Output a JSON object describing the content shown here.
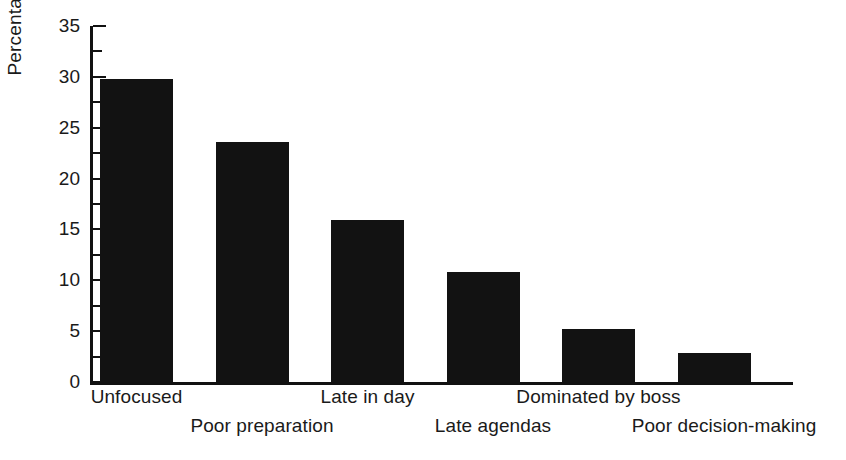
{
  "chart_data": {
    "type": "bar",
    "title": "",
    "subtitle": "",
    "xlabel": "",
    "ylabel": "Percentage",
    "ylim": [
      0,
      35
    ],
    "ytick_values": [
      0,
      5,
      10,
      15,
      20,
      25,
      30,
      35
    ],
    "ytick_labels": [
      "0",
      "5",
      "10",
      "15",
      "20",
      "25",
      "30",
      "35"
    ],
    "minor_tick_interval": 2.5,
    "grid": false,
    "legend": null,
    "bar_color": "#121212",
    "axis_color": "#111111",
    "background_color": "#ffffff",
    "categories": [
      "Unfocused",
      "Poor preparation",
      "Late in day",
      "Late agendas",
      "Dominated by boss",
      "Poor decision-making"
    ],
    "values": [
      29.8,
      23.6,
      15.9,
      10.8,
      5.2,
      2.9
    ],
    "label_rows": [
      1,
      2,
      1,
      2,
      1,
      2
    ]
  }
}
